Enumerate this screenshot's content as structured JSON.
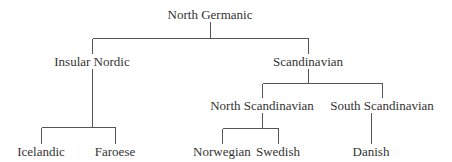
{
  "diagram": {
    "type": "tree",
    "root": "North Germanic",
    "nodes": {
      "north_germanic": {
        "label": "North Germanic",
        "x": 210,
        "y": 14
      },
      "insular_nordic": {
        "label": "Insular Nordic",
        "x": 92,
        "y": 61
      },
      "scandinavian": {
        "label": "Scandinavian",
        "x": 308,
        "y": 61
      },
      "north_scandinavian": {
        "label": "North Scandinavian",
        "x": 262,
        "y": 105
      },
      "south_scandinavian": {
        "label": "South Scandinavian",
        "x": 382,
        "y": 105
      },
      "icelandic": {
        "label": "Icelandic",
        "x": 41,
        "y": 151
      },
      "faroese": {
        "label": "Faroese",
        "x": 115,
        "y": 151
      },
      "norwegian": {
        "label": "Norwegian",
        "x": 222,
        "y": 151
      },
      "swedish": {
        "label": "Swedish",
        "x": 278,
        "y": 151
      },
      "danish": {
        "label": "Danish",
        "x": 371,
        "y": 151
      }
    },
    "edges": [
      [
        "North Germanic",
        "Insular Nordic"
      ],
      [
        "North Germanic",
        "Scandinavian"
      ],
      [
        "Insular Nordic",
        "Icelandic"
      ],
      [
        "Insular Nordic",
        "Faroese"
      ],
      [
        "Scandinavian",
        "North Scandinavian"
      ],
      [
        "Scandinavian",
        "South Scandinavian"
      ],
      [
        "North Scandinavian",
        "Norwegian"
      ],
      [
        "North Scandinavian",
        "Swedish"
      ],
      [
        "South Scandinavian",
        "Danish"
      ]
    ],
    "colors": {
      "line": "#555555",
      "text": "#333333",
      "background": "#ffffff"
    }
  }
}
